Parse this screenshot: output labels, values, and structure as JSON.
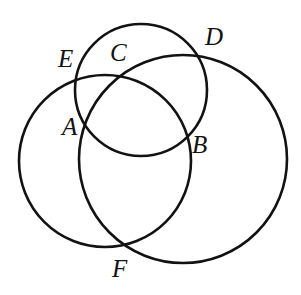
{
  "figure": {
    "type": "venn-three-circles",
    "background_color": "#ffffff",
    "stroke_color": "#121212",
    "stroke_width": 2.6,
    "width": 301,
    "height": 295
  },
  "circles": [
    {
      "id": "left-circle",
      "name": "left-circle",
      "cx": 105,
      "cy": 161,
      "r": 86
    },
    {
      "id": "top-circle",
      "name": "top-circle",
      "cx": 141,
      "cy": 90,
      "r": 66
    },
    {
      "id": "right-circle",
      "name": "right-circle",
      "cx": 183,
      "cy": 159,
      "r": 104
    }
  ],
  "labels": [
    {
      "id": "E",
      "text": "E",
      "x": 58,
      "y": 46,
      "description": "intersection of left circle and right circle, upper left"
    },
    {
      "id": "C",
      "text": "C",
      "x": 110,
      "y": 40,
      "description": "inside top circle, above intersections"
    },
    {
      "id": "D",
      "text": "D",
      "x": 205,
      "y": 24,
      "description": "intersection of top circle and right circle, upper right"
    },
    {
      "id": "A",
      "text": "A",
      "x": 62,
      "y": 114,
      "description": "intersection of left circle and top circle, left"
    },
    {
      "id": "B",
      "text": "B",
      "x": 192,
      "y": 132,
      "description": "intersection of top circle and right circle, lower right"
    },
    {
      "id": "F",
      "text": "F",
      "x": 112,
      "y": 256,
      "description": "intersection of left circle and right circle, bottom"
    }
  ],
  "label_text": {
    "A": "A",
    "B": "B",
    "C": "C",
    "D": "D",
    "E": "E",
    "F": "F"
  },
  "chart_data": {
    "type": "diagram",
    "shapes": [
      {
        "shape": "circle",
        "label": "left",
        "center": [
          105,
          161
        ],
        "radius": 86
      },
      {
        "shape": "circle",
        "label": "top",
        "center": [
          141,
          90
        ],
        "radius": 66
      },
      {
        "shape": "circle",
        "label": "right",
        "center": [
          183,
          159
        ],
        "radius": 104
      }
    ],
    "annotations": [
      {
        "label": "A",
        "position": [
          88,
          130
        ]
      },
      {
        "label": "B",
        "position": [
          188,
          140
        ]
      },
      {
        "label": "C",
        "position": [
          120,
          52
        ]
      },
      {
        "label": "D",
        "position": [
          198,
          55
        ]
      },
      {
        "label": "E",
        "position": [
          80,
          77
        ]
      },
      {
        "label": "F",
        "position": [
          123,
          247
        ]
      }
    ],
    "legend": [],
    "grid": false
  }
}
